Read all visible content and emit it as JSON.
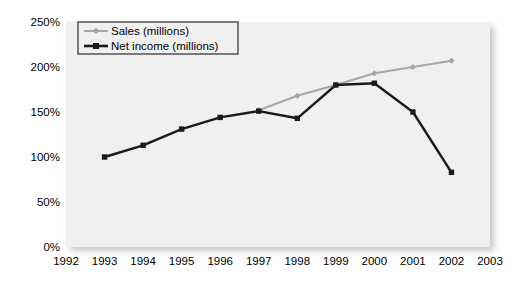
{
  "chart_data": {
    "type": "line",
    "title": "",
    "xlabel": "",
    "ylabel": "",
    "x": [
      1992,
      1993,
      1994,
      1995,
      1996,
      1997,
      1998,
      1999,
      2000,
      2001,
      2002,
      2003
    ],
    "xtick_labels": [
      "1992",
      "1993",
      "1994",
      "1995",
      "1996",
      "1997",
      "1998",
      "1999",
      "2000",
      "2001",
      "2002",
      "2003"
    ],
    "xlim": [
      1992,
      2003
    ],
    "ylim": [
      0,
      250
    ],
    "ytick_labels": [
      "0%",
      "50%",
      "100%",
      "150%",
      "200%",
      "250%"
    ],
    "ytick_values": [
      0,
      50,
      100,
      150,
      200,
      250
    ],
    "grid": false,
    "legend_position": "top-left",
    "value_suffix": "%",
    "series": [
      {
        "name": "Sales (millions)",
        "color": "#a6a6a6",
        "marker": "diamond",
        "points": [
          {
            "x": 1997,
            "y": 152
          },
          {
            "x": 1998,
            "y": 168
          },
          {
            "x": 1999,
            "y": 180
          },
          {
            "x": 2000,
            "y": 193
          },
          {
            "x": 2001,
            "y": 200
          },
          {
            "x": 2002,
            "y": 207
          }
        ]
      },
      {
        "name": "Net income (millions)",
        "color": "#1a1a1a",
        "marker": "square",
        "points": [
          {
            "x": 1993,
            "y": 100
          },
          {
            "x": 1994,
            "y": 113
          },
          {
            "x": 1995,
            "y": 131
          },
          {
            "x": 1996,
            "y": 144
          },
          {
            "x": 1997,
            "y": 151
          },
          {
            "x": 1998,
            "y": 143
          },
          {
            "x": 1999,
            "y": 180
          },
          {
            "x": 2000,
            "y": 182
          },
          {
            "x": 2001,
            "y": 150
          },
          {
            "x": 2002,
            "y": 83
          }
        ]
      }
    ]
  },
  "legend": {
    "entries": [
      {
        "label": "Sales (millions)"
      },
      {
        "label": "Net income (millions)"
      }
    ]
  },
  "colors": {
    "plot_background": "#f0f0f0",
    "sales_line": "#a6a6a6",
    "net_income_line": "#1a1a1a",
    "legend_border": "#2b2b2b",
    "legend_background": "#f0f0f0",
    "axis_text": "#000000"
  }
}
